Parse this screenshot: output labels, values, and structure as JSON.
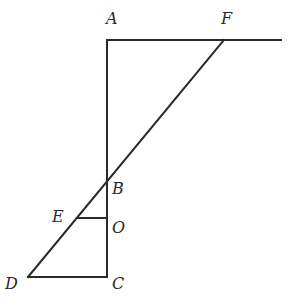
{
  "diagram": {
    "type": "geometry",
    "stroke_color": "#2a2a2a",
    "background": "#ffffff",
    "points": {
      "A": {
        "label": "A",
        "x": 107,
        "y": 40,
        "label_x": 106,
        "label_y": 24
      },
      "F": {
        "label": "F",
        "x": 224,
        "y": 40,
        "label_x": 221,
        "label_y": 24
      },
      "B": {
        "label": "B",
        "x": 107,
        "y": 181,
        "label_x": 112,
        "label_y": 194
      },
      "O": {
        "label": "O",
        "x": 107,
        "y": 218,
        "label_x": 112,
        "label_y": 233
      },
      "E": {
        "label": "E",
        "x": 77,
        "y": 218,
        "label_x": 52,
        "label_y": 222
      },
      "D": {
        "label": "D",
        "x": 28,
        "y": 277,
        "label_x": 5,
        "label_y": 289
      },
      "C": {
        "label": "C",
        "x": 107,
        "y": 277,
        "label_x": 112,
        "label_y": 289
      }
    },
    "segments": [
      {
        "name": "top-line",
        "from": "A",
        "to": "end",
        "x1": 107,
        "y1": 40,
        "x2": 281,
        "y2": 40
      },
      {
        "name": "AC",
        "x1": 107,
        "y1": 40,
        "x2": 107,
        "y2": 277
      },
      {
        "name": "DF",
        "x1": 28,
        "y1": 277,
        "x2": 224,
        "y2": 40
      },
      {
        "name": "EO",
        "x1": 77,
        "y1": 218,
        "x2": 107,
        "y2": 218
      },
      {
        "name": "DC",
        "x1": 28,
        "y1": 277,
        "x2": 107,
        "y2": 277
      }
    ]
  }
}
